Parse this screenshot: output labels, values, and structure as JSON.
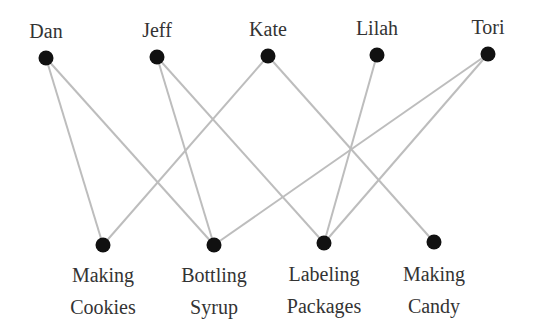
{
  "diagram": {
    "type": "bipartite-graph",
    "colors": {
      "node": "#111111",
      "edge": "#bdbdbd",
      "text": "#333333",
      "background": "#ffffff"
    },
    "people": [
      {
        "id": "dan",
        "label": "Dan",
        "x": 46,
        "y": 58,
        "label_y": 18
      },
      {
        "id": "jeff",
        "label": "Jeff",
        "x": 157,
        "y": 57,
        "label_y": 17
      },
      {
        "id": "kate",
        "label": "Kate",
        "x": 268,
        "y": 56,
        "label_y": 16
      },
      {
        "id": "lilah",
        "label": "Lilah",
        "x": 377,
        "y": 55,
        "label_y": 15
      },
      {
        "id": "tori",
        "label": "Tori",
        "x": 488,
        "y": 54,
        "label_y": 14
      }
    ],
    "tasks": [
      {
        "id": "making-cookies",
        "line1": "Making",
        "line2": "Cookies",
        "x": 103,
        "y": 245,
        "label_y": 259
      },
      {
        "id": "bottling-syrup",
        "line1": "Bottling",
        "line2": "Syrup",
        "x": 214,
        "y": 245,
        "label_y": 259
      },
      {
        "id": "labeling-packages",
        "line1": "Labeling",
        "line2": "Packages",
        "x": 324,
        "y": 243,
        "label_y": 258
      },
      {
        "id": "making-candy",
        "line1": "Making",
        "line2": "Candy",
        "x": 434,
        "y": 242,
        "label_y": 258
      }
    ],
    "edges": [
      {
        "from": "dan",
        "to": "making-cookies"
      },
      {
        "from": "dan",
        "to": "bottling-syrup"
      },
      {
        "from": "jeff",
        "to": "bottling-syrup"
      },
      {
        "from": "jeff",
        "to": "labeling-packages"
      },
      {
        "from": "kate",
        "to": "making-cookies"
      },
      {
        "from": "kate",
        "to": "making-candy"
      },
      {
        "from": "lilah",
        "to": "labeling-packages"
      },
      {
        "from": "tori",
        "to": "bottling-syrup"
      },
      {
        "from": "tori",
        "to": "labeling-packages"
      }
    ]
  }
}
